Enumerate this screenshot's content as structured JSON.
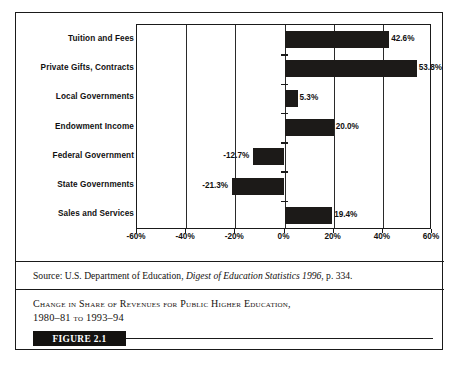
{
  "figure": {
    "badge_label": "FIGURE 2.1",
    "caption_line1": "Change in Share of Revenues for Public Higher Education,",
    "caption_line2_year1": "1980–81",
    "caption_line2_connector": "to",
    "caption_line2_year2": "1993–94",
    "source_prefix": "Source: U.S. Department of Education,",
    "source_title": "Digest of Education Statistics 1996",
    "source_suffix": ", p. 334."
  },
  "chart_data": {
    "type": "bar",
    "orientation": "horizontal",
    "title": "Change in Share of Revenues for Public Higher Education, 1980–81 to 1993–94",
    "xlabel": "",
    "ylabel": "",
    "xlim": [
      -60,
      60
    ],
    "xticks": [
      -60,
      -40,
      -20,
      0,
      20,
      40,
      60
    ],
    "xtick_labels": [
      "-60%",
      "-40%",
      "-20%",
      "0%",
      "20%",
      "40%",
      "60%"
    ],
    "grid": true,
    "legend": false,
    "categories": [
      "Tuition and Fees",
      "Private Gifts, Contracts",
      "Local Governments",
      "Endowment Income",
      "Federal Government",
      "State Governments",
      "Sales and Services"
    ],
    "values": [
      42.6,
      53.8,
      5.3,
      20.0,
      -12.7,
      -21.3,
      19.4
    ],
    "value_labels": [
      "42.6%",
      "53.8%",
      "5.3%",
      "20.0%",
      "-12.7%",
      "-21.3%",
      "19.4%"
    ],
    "bar_color": "#1c1a18"
  }
}
